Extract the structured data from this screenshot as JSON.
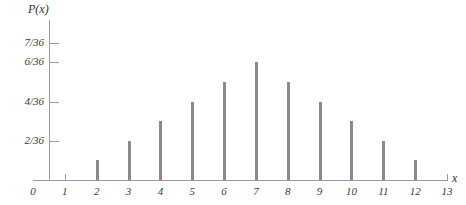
{
  "chart_data": {
    "type": "bar",
    "title": "",
    "xlabel": "x",
    "ylabel": "P(x)",
    "categories": [
      2,
      3,
      4,
      5,
      6,
      7,
      8,
      9,
      10,
      11,
      12
    ],
    "values": [
      1,
      2,
      3,
      4,
      5,
      6,
      5,
      4,
      3,
      2,
      1
    ],
    "value_labels": [
      "1/36",
      "2/36",
      "3/36",
      "4/36",
      "5/36",
      "6/36",
      "5/36",
      "4/36",
      "3/36",
      "2/36",
      "1/36"
    ],
    "value_denominator": 36,
    "xlim": [
      0,
      13
    ],
    "ylim": [
      0,
      7.6
    ],
    "x_ticks": [
      0,
      1,
      2,
      3,
      4,
      5,
      6,
      7,
      8,
      9,
      10,
      11,
      12,
      13
    ],
    "x_tick_labels": [
      "0",
      "1",
      "2",
      "3",
      "4",
      "5",
      "6",
      "7",
      "8",
      "9",
      "10",
      "11",
      "12",
      "13"
    ],
    "y_ticks": [
      2,
      4,
      6,
      7
    ],
    "y_tick_labels": [
      "2/36",
      "4/36",
      "6/36",
      "7/36"
    ],
    "grid": false,
    "legend": null,
    "bar_color": "#8a8a8a",
    "axis_color": "#9a9a9a",
    "text_color": "#3a3a3a"
  }
}
